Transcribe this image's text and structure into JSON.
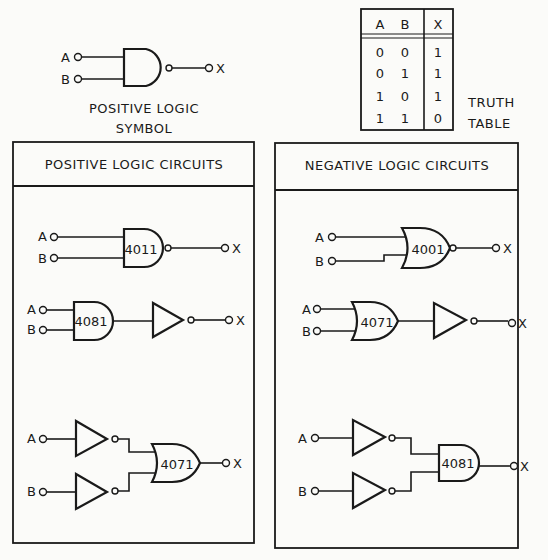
{
  "symbol": {
    "inputs": [
      "A",
      "B"
    ],
    "output": "X",
    "caption_line1": "POSITIVE LOGIC",
    "caption_line2": "SYMBOL"
  },
  "truth_table": {
    "headers": [
      "A",
      "B",
      "X"
    ],
    "rows": [
      [
        "0",
        "0",
        "1"
      ],
      [
        "0",
        "1",
        "1"
      ],
      [
        "1",
        "0",
        "1"
      ],
      [
        "1",
        "1",
        "0"
      ]
    ],
    "caption_line1": "TRUTH",
    "caption_line2": "TABLE"
  },
  "positive_panel": {
    "title": "POSITIVE LOGIC CIRCUITS",
    "circuit1": {
      "a": "A",
      "b": "B",
      "x": "X",
      "chip": "4011"
    },
    "circuit2": {
      "a": "A",
      "b": "B",
      "x": "X",
      "chip": "4081"
    },
    "circuit3": {
      "a": "A",
      "b": "B",
      "x": "X",
      "chip": "4071"
    }
  },
  "negative_panel": {
    "title": "NEGATIVE LOGIC CIRCUITS",
    "circuit1": {
      "a": "A",
      "b": "B",
      "x": "X",
      "chip": "4001"
    },
    "circuit2": {
      "a": "A",
      "b": "B",
      "x": "X",
      "chip": "4071"
    },
    "circuit3": {
      "a": "A",
      "b": "B",
      "x": "X",
      "chip": "4081"
    }
  }
}
